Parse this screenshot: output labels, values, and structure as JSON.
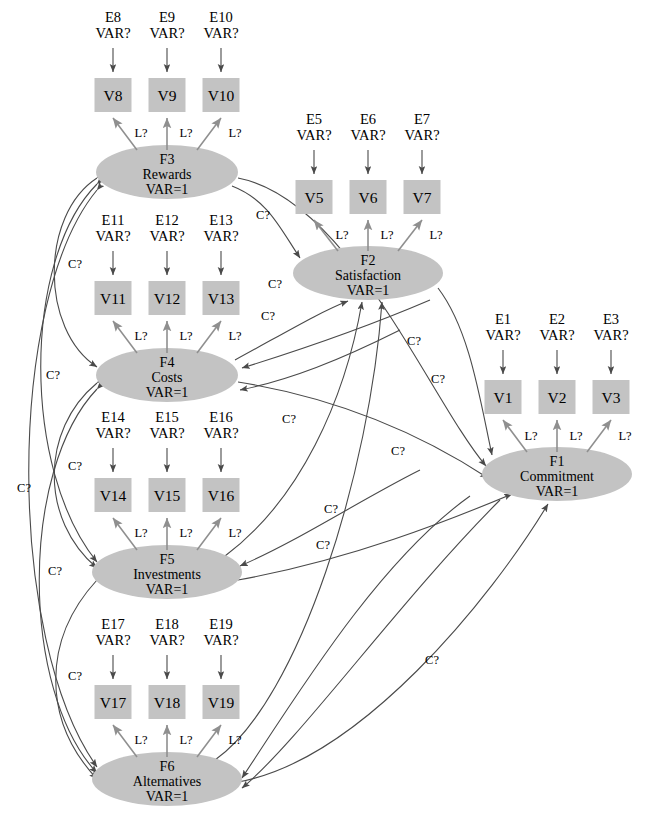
{
  "diagram": {
    "var_fixed_label": "VAR=1",
    "var_free_label": "VAR?",
    "loading_label": "L?",
    "covariance_label": "C?",
    "colors": {
      "node_fill": "#c3c3c3",
      "edge": "#4a4a4a",
      "background": "#ffffff",
      "text": "#000000"
    }
  },
  "factors": [
    {
      "id": "F3",
      "code": "F3",
      "name": "Rewards",
      "variance": "VAR=1",
      "cx": 167,
      "cy": 172
    },
    {
      "id": "F2",
      "code": "F2",
      "name": "Satisfaction",
      "variance": "VAR=1",
      "cx": 368,
      "cy": 273
    },
    {
      "id": "F4",
      "code": "F4",
      "name": "Costs",
      "variance": "VAR=1",
      "cx": 167,
      "cy": 375
    },
    {
      "id": "F1",
      "code": "F1",
      "name": "Commitment",
      "variance": "VAR=1",
      "cx": 557,
      "cy": 474
    },
    {
      "id": "F5",
      "code": "F5",
      "name": "Investments",
      "variance": "VAR=1",
      "cx": 167,
      "cy": 572
    },
    {
      "id": "F6",
      "code": "F6",
      "name": "Alternatives",
      "variance": "VAR=1",
      "cx": 167,
      "cy": 779
    }
  ],
  "indicator_groups": [
    {
      "factor": "F3",
      "errors": [
        "E8",
        "E9",
        "E10"
      ],
      "variables": [
        "V8",
        "V9",
        "V10"
      ],
      "err_y": 22,
      "box_y": 78,
      "xs": [
        113,
        167,
        221
      ]
    },
    {
      "factor": "F2",
      "errors": [
        "E5",
        "E6",
        "E7"
      ],
      "variables": [
        "V5",
        "V6",
        "V7"
      ],
      "err_y": 124,
      "box_y": 180,
      "xs": [
        314,
        368,
        422
      ]
    },
    {
      "factor": "F4",
      "errors": [
        "E11",
        "E12",
        "E13"
      ],
      "variables": [
        "V11",
        "V12",
        "V13"
      ],
      "err_y": 225,
      "box_y": 281,
      "xs": [
        113,
        167,
        221
      ]
    },
    {
      "factor": "F1",
      "errors": [
        "E1",
        "E2",
        "E3"
      ],
      "variables": [
        "V1",
        "V2",
        "V3"
      ],
      "err_y": 324,
      "box_y": 380,
      "xs": [
        503,
        557,
        611
      ]
    },
    {
      "factor": "F5",
      "errors": [
        "E14",
        "E15",
        "E16"
      ],
      "variables": [
        "V14",
        "V15",
        "V16"
      ],
      "err_y": 422,
      "box_y": 478,
      "xs": [
        113,
        167,
        221
      ]
    },
    {
      "factor": "F6",
      "errors": [
        "E17",
        "E18",
        "E19"
      ],
      "variables": [
        "V17",
        "V18",
        "V19"
      ],
      "err_y": 629,
      "box_y": 685,
      "xs": [
        113,
        167,
        221
      ]
    }
  ],
  "loadings": [
    {
      "label": "L?",
      "x": 141,
      "y": 137
    },
    {
      "label": "L?",
      "x": 186,
      "y": 137
    },
    {
      "label": "L?",
      "x": 235,
      "y": 137
    },
    {
      "label": "L?",
      "x": 342,
      "y": 239
    },
    {
      "label": "L?",
      "x": 387,
      "y": 239
    },
    {
      "label": "L?",
      "x": 436,
      "y": 239
    },
    {
      "label": "L?",
      "x": 141,
      "y": 340
    },
    {
      "label": "L?",
      "x": 186,
      "y": 340
    },
    {
      "label": "L?",
      "x": 235,
      "y": 340
    },
    {
      "label": "L?",
      "x": 531,
      "y": 440
    },
    {
      "label": "L?",
      "x": 576,
      "y": 440
    },
    {
      "label": "L?",
      "x": 625,
      "y": 440
    },
    {
      "label": "L?",
      "x": 141,
      "y": 537
    },
    {
      "label": "L?",
      "x": 186,
      "y": 537
    },
    {
      "label": "L?",
      "x": 235,
      "y": 537
    },
    {
      "label": "L?",
      "x": 141,
      "y": 744
    },
    {
      "label": "L?",
      "x": 186,
      "y": 744
    },
    {
      "label": "L?",
      "x": 235,
      "y": 744
    }
  ],
  "covariance_labels": [
    {
      "label": "C?",
      "x": 263,
      "y": 219
    },
    {
      "label": "C?",
      "x": 75,
      "y": 268
    },
    {
      "label": "C?",
      "x": 275,
      "y": 288
    },
    {
      "label": "C?",
      "x": 268,
      "y": 320
    },
    {
      "label": "C?",
      "x": 53,
      "y": 379
    },
    {
      "label": "C?",
      "x": 438,
      "y": 383
    },
    {
      "label": "C?",
      "x": 414,
      "y": 345
    },
    {
      "label": "C?",
      "x": 75,
      "y": 470
    },
    {
      "label": "C?",
      "x": 289,
      "y": 423
    },
    {
      "label": "C?",
      "x": 398,
      "y": 455
    },
    {
      "label": "C?",
      "x": 24,
      "y": 492
    },
    {
      "label": "C?",
      "x": 331,
      "y": 513
    },
    {
      "label": "C?",
      "x": 55,
      "y": 575
    },
    {
      "label": "C?",
      "x": 323,
      "y": 549
    },
    {
      "label": "C?",
      "x": 75,
      "y": 680
    },
    {
      "label": "C?",
      "x": 432,
      "y": 664
    }
  ],
  "counts": {
    "factors": 6,
    "observed_variables": 19,
    "error_terms": 19
  }
}
